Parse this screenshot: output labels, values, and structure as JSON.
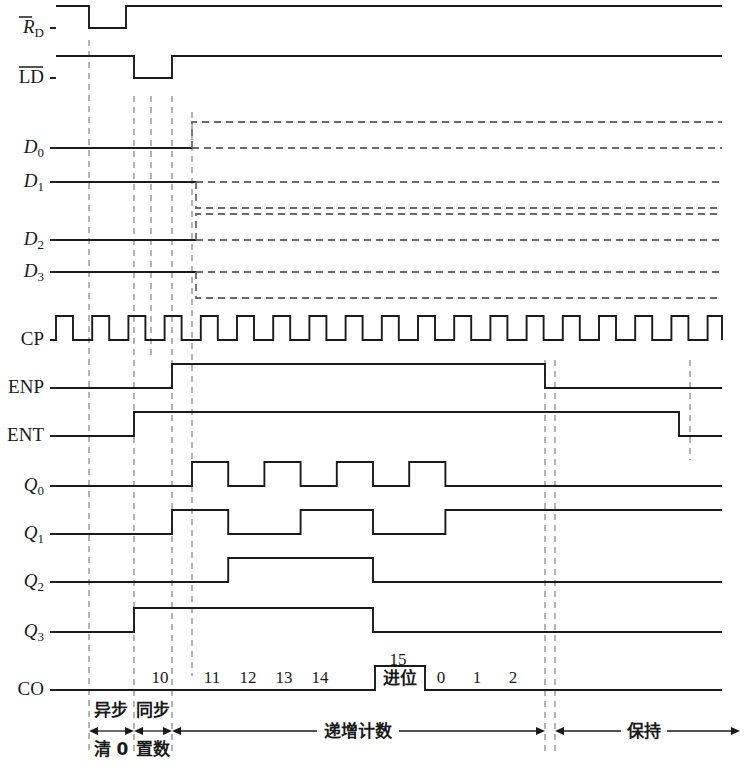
{
  "diagram": {
    "colors": {
      "line": "#1a1a1a",
      "dashed": "#6b6b6b",
      "background": "#ffffff"
    },
    "time_axis": {
      "cp_start_x": 56,
      "cp_period": 36.2,
      "cycles": 19
    }
  },
  "signals": [
    {
      "id": "RD",
      "label": "R",
      "sub": "D",
      "overline": true,
      "kind": "logic",
      "y": 28,
      "row_label_x": 44
    },
    {
      "id": "LD",
      "label": "LD",
      "sub": "",
      "overline": true,
      "kind": "logic",
      "y": 78,
      "row_label_x": 44
    },
    {
      "id": "D0",
      "label": "D",
      "sub": "0",
      "overline": false,
      "kind": "data",
      "y": 148,
      "row_label_x": 44
    },
    {
      "id": "D1",
      "label": "D",
      "sub": "1",
      "overline": false,
      "kind": "data",
      "y": 182,
      "row_label_x": 44
    },
    {
      "id": "D2",
      "label": "D",
      "sub": "2",
      "overline": false,
      "kind": "data",
      "y": 240,
      "row_label_x": 44
    },
    {
      "id": "D3",
      "label": "D",
      "sub": "3",
      "overline": false,
      "kind": "data",
      "y": 272,
      "row_label_x": 44
    },
    {
      "id": "CP",
      "label": "CP",
      "sub": "",
      "overline": false,
      "kind": "clock",
      "y": 340,
      "row_label_x": 44
    },
    {
      "id": "ENP",
      "label": "ENP",
      "sub": "",
      "overline": false,
      "kind": "logic",
      "y": 388,
      "row_label_x": 44
    },
    {
      "id": "ENT",
      "label": "ENT",
      "sub": "",
      "overline": false,
      "kind": "logic",
      "y": 436,
      "row_label_x": 44
    },
    {
      "id": "Q0",
      "label": "Q",
      "sub": "0",
      "overline": false,
      "kind": "logic",
      "y": 486,
      "row_label_x": 44
    },
    {
      "id": "Q1",
      "label": "Q",
      "sub": "1",
      "overline": false,
      "kind": "logic",
      "y": 534,
      "row_label_x": 44
    },
    {
      "id": "Q2",
      "label": "Q",
      "sub": "2",
      "overline": false,
      "kind": "logic",
      "y": 582,
      "row_label_x": 44
    },
    {
      "id": "Q3",
      "label": "Q",
      "sub": "3",
      "overline": false,
      "kind": "logic",
      "y": 632,
      "row_label_x": 44
    },
    {
      "id": "CO",
      "label": "CO",
      "sub": "",
      "overline": false,
      "kind": "logic",
      "y": 690,
      "row_label_x": 44
    }
  ],
  "count_sequence": [
    {
      "value": "10",
      "x": 160
    },
    {
      "value": "11",
      "x": 212
    },
    {
      "value": "12",
      "x": 248
    },
    {
      "value": "13",
      "x": 284
    },
    {
      "value": "14",
      "x": 320
    },
    {
      "value": "15",
      "x": 398
    },
    {
      "value": "0",
      "x": 441
    },
    {
      "value": "1",
      "x": 477
    },
    {
      "value": "2",
      "x": 513
    }
  ],
  "carry_box": {
    "label": "进位",
    "x": 375,
    "width": 50,
    "top_value": "15"
  },
  "phase_annotations": [
    {
      "id": "async-clear",
      "line1": "异步",
      "line2": "清 0",
      "center_x": 111,
      "start_x": 89,
      "end_x": 134
    },
    {
      "id": "sync-load",
      "line1": "同步",
      "line2": "置数",
      "center_x": 153,
      "start_x": 134,
      "end_x": 172
    },
    {
      "id": "count-up",
      "line1": "递增计数",
      "line2": "",
      "center_x": 358,
      "start_x": 172,
      "end_x": 545
    },
    {
      "id": "hold",
      "line1": "保持",
      "line2": "",
      "center_x": 644,
      "start_x": 555,
      "end_x": 740
    }
  ],
  "dashed_markers": [
    {
      "id": "m-clear-start",
      "x": 89,
      "y1": 40,
      "y2": 752
    },
    {
      "id": "m-load-start",
      "x": 134,
      "y1": 96,
      "y2": 752
    },
    {
      "id": "m-load-mid",
      "x": 151,
      "y1": 96,
      "y2": 360
    },
    {
      "id": "m-load-end",
      "x": 172,
      "y1": 96,
      "y2": 752
    },
    {
      "id": "m-count-start",
      "x": 192,
      "y1": 112,
      "y2": 676
    },
    {
      "id": "m-enp-fall",
      "x": 545,
      "y1": 360,
      "y2": 752
    },
    {
      "id": "m-hold-start",
      "x": 555,
      "y1": 360,
      "y2": 752
    },
    {
      "id": "m-ent-fall",
      "x": 690,
      "y1": 360,
      "y2": 460
    }
  ]
}
